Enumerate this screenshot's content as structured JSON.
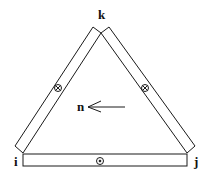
{
  "diagram": {
    "type": "triangular current loop of strips",
    "vertices": {
      "top": "k",
      "bottom_left": "i",
      "bottom_right": "j"
    },
    "normal_label": "n",
    "symbols": {
      "left_strip": "⊗",
      "right_strip": "⊗",
      "bottom_strip": "⊙"
    },
    "colors": {
      "stroke": "#1a1a1a",
      "background": "#ffffff"
    }
  }
}
